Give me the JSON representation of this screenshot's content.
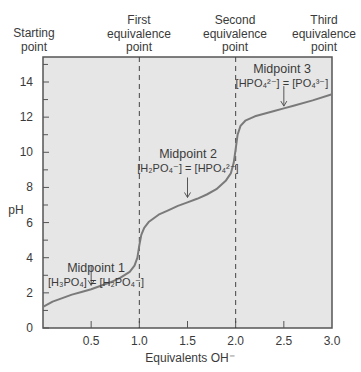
{
  "chart_data": {
    "type": "line",
    "title": "",
    "xlabel": "Equivalents OH⁻",
    "ylabel": "pH",
    "xlim": [
      0,
      3.0
    ],
    "ylim": [
      0,
      15.4
    ],
    "x_ticks": [
      "0.5",
      "1.0",
      "1.5",
      "2.0",
      "2.5",
      "3.0"
    ],
    "y_ticks": [
      "0",
      "2",
      "4",
      "6",
      "8",
      "10",
      "12",
      "14"
    ],
    "grid": false,
    "background": "#e6e6e6",
    "series": [
      {
        "name": "Titration curve of H3PO4",
        "x": [
          0.0,
          0.1,
          0.2,
          0.3,
          0.4,
          0.5,
          0.6,
          0.7,
          0.8,
          0.9,
          0.95,
          0.98,
          1.0,
          1.02,
          1.05,
          1.1,
          1.2,
          1.3,
          1.4,
          1.5,
          1.6,
          1.7,
          1.8,
          1.9,
          1.95,
          1.98,
          2.0,
          2.02,
          2.05,
          2.1,
          2.2,
          2.4,
          2.5,
          2.6,
          2.8,
          3.0
        ],
        "y": [
          1.2,
          1.5,
          1.7,
          1.9,
          2.05,
          2.2,
          2.4,
          2.6,
          2.85,
          3.2,
          3.55,
          4.0,
          4.7,
          5.3,
          5.7,
          6.05,
          6.45,
          6.7,
          6.95,
          7.15,
          7.35,
          7.6,
          7.9,
          8.4,
          8.8,
          9.4,
          10.2,
          11.0,
          11.5,
          11.8,
          12.05,
          12.35,
          12.5,
          12.65,
          12.95,
          13.3
        ]
      }
    ],
    "vertical_lines": [
      {
        "x": 1.0,
        "style": "dashed",
        "label": "First equivalence point"
      },
      {
        "x": 2.0,
        "style": "dashed",
        "label": "Second equivalence point"
      }
    ],
    "annotations": [
      {
        "title": "Midpoint 1",
        "eq_left": "[H₃PO₄]",
        "eq_right": "[H₂PO₄⁻]",
        "x": 0.5,
        "pH": 2.2
      },
      {
        "title": "Midpoint 2",
        "eq_left": "[H₂PO₄⁻]",
        "eq_right": "[HPO₄²⁻]",
        "x": 1.5,
        "pH": 7.2
      },
      {
        "title": "Midpoint 3",
        "eq_left": "[HPO₄²⁻]",
        "eq_right": "[PO₄³⁻]",
        "x": 2.5,
        "pH": 12.4
      }
    ],
    "top_labels": [
      {
        "line1": "",
        "line2": "Starting",
        "line3": "point"
      },
      {
        "line1": "First",
        "line2": "equivalence",
        "line3": "point"
      },
      {
        "line1": "Second",
        "line2": "equivalence",
        "line3": "point"
      },
      {
        "line1": "Third",
        "line2": "equivalence",
        "line3": "point"
      }
    ]
  }
}
